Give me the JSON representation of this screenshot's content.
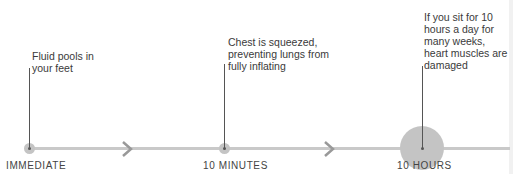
{
  "timeline": {
    "stages": [
      {
        "label": "IMMEDIATE",
        "note": "Fluid pools in your feet"
      },
      {
        "label": "10 MINUTES",
        "note": "Chest is squeezed, preventing lungs from fully inflating"
      },
      {
        "label": "10 HOURS",
        "note": "If you sit for 10 hours a day for many weeks, heart muscles are damaged"
      }
    ],
    "colors": {
      "line": "#c9c9c9",
      "dot": "#c4c4c4",
      "text": "#3a3a3a"
    }
  }
}
